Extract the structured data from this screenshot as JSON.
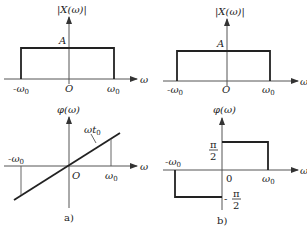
{
  "figure": {
    "panel_a": {
      "caption": "a)",
      "magnitude": {
        "y_label": "|X(ω)|",
        "x_label": "ω",
        "level_label": "A",
        "ticks": {
          "neg": "-ω",
          "neg_sub": "0",
          "origin": "O",
          "pos": "ω",
          "pos_sub": "0"
        }
      },
      "phase": {
        "y_label": "φ(ω)",
        "x_label": "ω",
        "slope_label": "ωt",
        "slope_sub": "0",
        "ticks": {
          "neg": "-ω",
          "neg_sub": "0",
          "origin": "O",
          "pos": "ω",
          "pos_sub": "0"
        }
      }
    },
    "panel_b": {
      "caption": "b)",
      "magnitude": {
        "y_label": "|X(ω)|",
        "x_label": "ω",
        "level_label": "A",
        "ticks": {
          "neg": "-ω",
          "neg_sub": "0",
          "origin": "O",
          "pos": "ω",
          "pos_sub": "0"
        }
      },
      "phase": {
        "y_label": "φ(ω)",
        "x_label": "ω",
        "pos_level": {
          "num": "π",
          "den": "2"
        },
        "neg_level": {
          "sign": "-",
          "num": "π",
          "den": "2"
        },
        "ticks": {
          "neg": "-ω",
          "neg_sub": "0",
          "origin": "0",
          "pos": "ω",
          "pos_sub": "0"
        }
      }
    }
  }
}
